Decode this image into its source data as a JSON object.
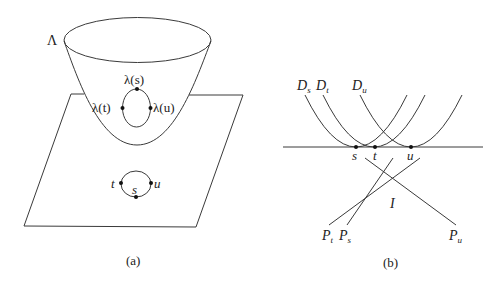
{
  "panels": [
    {
      "id": "a",
      "caption": "(a)",
      "surface_label": "Λ",
      "upper_loop_labels": {
        "top": "λ(s)",
        "left": "λ(t)",
        "right": "λ(u)"
      },
      "lower_loop_labels": {
        "left": "t",
        "bottom": "s",
        "right": "u"
      }
    },
    {
      "id": "b",
      "caption": "(b)",
      "curve_labels": {
        "ds_main": "D",
        "ds_sub": "s",
        "dt_main": "D",
        "dt_sub": "t",
        "du_main": "D",
        "du_sub": "u"
      },
      "point_labels": {
        "s": "s",
        "t": "t",
        "u": "u"
      },
      "line_labels": {
        "pt_main": "P",
        "pt_sub": "t",
        "ps_main": "P",
        "ps_sub": "s",
        "pu_main": "P",
        "pu_sub": "u"
      },
      "region_label": "I"
    }
  ],
  "colors": {
    "stroke": "#3a3a3a",
    "text": "#222222",
    "background": "#ffffff"
  }
}
